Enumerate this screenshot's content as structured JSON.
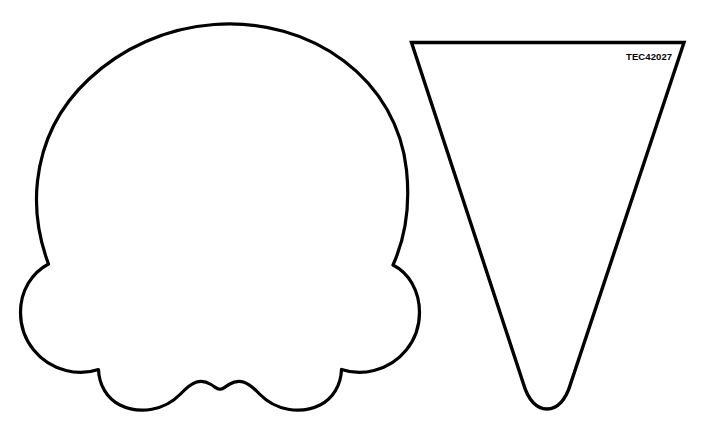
{
  "page": {
    "background_color": "#ffffff",
    "width": 706,
    "height": 439,
    "top_bleed_text": "··   ·· ··    ··  ···"
  },
  "artwork": {
    "title": "Ice cream scoop and cone cut-out template",
    "stroke_color": "#000000",
    "fill_color": "#ffffff",
    "stroke_width": "3"
  },
  "scoop": {
    "name": "Ice cream scoop outline",
    "description": "Cloud-like scalloped scoop: one large dome circle, two side lobes, two bottom lobes",
    "bounds": {
      "x": 21,
      "y": 22,
      "width": 398,
      "height": 388
    }
  },
  "cone": {
    "name": "Ice cream cone outline",
    "description": "Inverted tapered triangle with rounded U bottom",
    "bounds": {
      "x": 411,
      "y": 42,
      "width": 273,
      "height": 368
    },
    "label": "TEC42027"
  }
}
